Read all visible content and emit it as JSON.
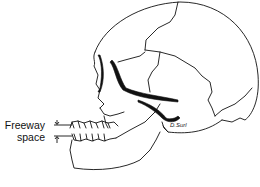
{
  "figure": {
    "labels": {
      "line1": "Freeway",
      "line2": "space"
    },
    "signature": "D.Surl",
    "colors": {
      "stroke": "#111111",
      "background": "#ffffff"
    }
  }
}
